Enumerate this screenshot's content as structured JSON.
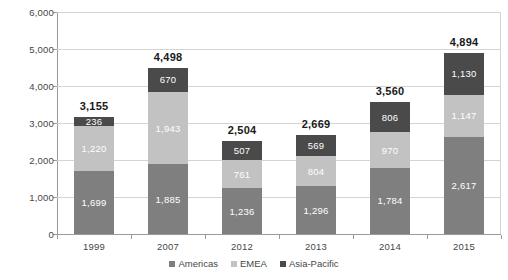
{
  "chart_data": {
    "type": "bar",
    "stacked": true,
    "title": "",
    "subtitle": "",
    "xlabel": "",
    "ylabel": "",
    "categories": [
      "1999",
      "2007",
      "2012",
      "2013",
      "2014",
      "2015"
    ],
    "ylim": [
      0,
      6000
    ],
    "ytick_labels": [
      "0",
      "1,000",
      "2,000",
      "3,000",
      "4,000",
      "5,000",
      "6,000"
    ],
    "ytick_values": [
      0,
      1000,
      2000,
      3000,
      4000,
      5000,
      6000
    ],
    "grid": "horizontal",
    "legend_position": "bottom-center",
    "series": [
      {
        "name": "Americas",
        "color": "#7f7f7f",
        "values": [
          1699,
          1885,
          1236,
          1296,
          1784,
          2617
        ],
        "labels": [
          "1,699",
          "1,885",
          "1,236",
          "1,296",
          "1,784",
          "2,617"
        ]
      },
      {
        "name": "EMEA",
        "color": "#c2c2c2",
        "values": [
          1220,
          1943,
          761,
          804,
          970,
          1147
        ],
        "labels": [
          "1,220",
          "1,943",
          "761",
          "804",
          "970",
          "1,147"
        ]
      },
      {
        "name": "Asia-Pacific",
        "color": "#4a4a4a",
        "values": [
          236,
          670,
          507,
          569,
          806,
          1130
        ],
        "labels": [
          "236",
          "670",
          "507",
          "569",
          "806",
          "1,130"
        ]
      }
    ],
    "totals": [
      3155,
      4498,
      2504,
      2669,
      3560,
      4894
    ],
    "total_labels": [
      "3,155",
      "4,498",
      "2,504",
      "2,669",
      "3,560",
      "4,894"
    ]
  },
  "legend": {
    "items": [
      {
        "label": "Americas",
        "color": "#7f7f7f"
      },
      {
        "label": "EMEA",
        "color": "#c2c2c2"
      },
      {
        "label": "Asia-Pacific",
        "color": "#4a4a4a"
      }
    ]
  }
}
